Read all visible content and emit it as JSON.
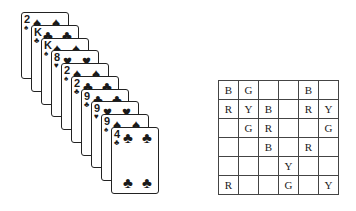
{
  "cards": [
    {
      "rank": "2",
      "suit": "♠",
      "left": 21,
      "top": 12
    },
    {
      "rank": "K",
      "suit": "♣",
      "left": 31,
      "top": 25
    },
    {
      "rank": "K",
      "suit": "♠",
      "left": 41,
      "top": 38
    },
    {
      "rank": "8",
      "suit": "♥",
      "left": 51,
      "top": 50
    },
    {
      "rank": "2",
      "suit": "♠",
      "left": 61,
      "top": 63
    },
    {
      "rank": "2",
      "suit": "♣",
      "left": 71,
      "top": 76
    },
    {
      "rank": "9",
      "suit": "♣",
      "left": 81,
      "top": 89
    },
    {
      "rank": "9",
      "suit": "♥",
      "left": 91,
      "top": 101
    },
    {
      "rank": "9",
      "suit": "♠",
      "left": 101,
      "top": 114
    },
    {
      "rank": "4",
      "suit": "♣",
      "left": 111,
      "top": 127
    }
  ],
  "grid": {
    "rows": [
      [
        "B",
        "G",
        "",
        "",
        "B",
        ""
      ],
      [
        "R",
        "Y",
        "B",
        "",
        "R",
        "Y"
      ],
      [
        "",
        "G",
        "R",
        "",
        "",
        "G"
      ],
      [
        "",
        "",
        "B",
        "",
        "R",
        ""
      ],
      [
        "",
        "",
        "",
        "Y",
        "",
        ""
      ],
      [
        "R",
        "",
        "",
        "G",
        "",
        "Y"
      ]
    ]
  }
}
